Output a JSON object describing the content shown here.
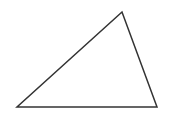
{
  "diagram": {
    "type": "triangle",
    "canvas": {
      "width": 172,
      "height": 117,
      "background": "#ffffff"
    },
    "stroke_color": "#333333",
    "fill_color": "#ffffff",
    "stroke_width": 1.5,
    "vertices": [
      {
        "name": "top",
        "x": 122,
        "y": 12
      },
      {
        "name": "bottom-left",
        "x": 17,
        "y": 107
      },
      {
        "name": "bottom-right",
        "x": 157,
        "y": 107
      }
    ]
  }
}
